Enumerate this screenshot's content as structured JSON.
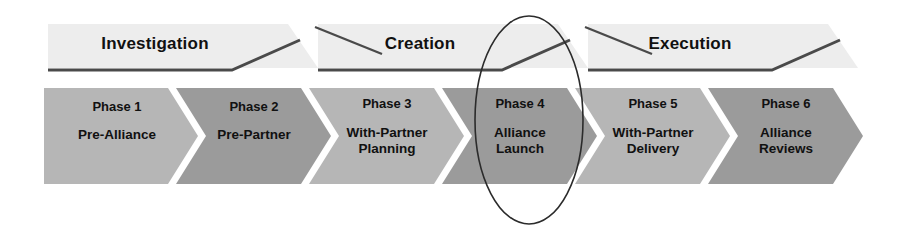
{
  "diagram": {
    "highlight": {
      "name": "ellipse-highlight",
      "target_phase": "Phase 4"
    },
    "colors": {
      "band_fill": "#ededed",
      "band_line": "#4a4a4a",
      "phase_light": "#b6b6b6",
      "phase_dark": "#9b9b9b",
      "text": "#111111",
      "highlight_stroke": "#2b2b2b",
      "background": "#ffffff"
    },
    "stages": [
      {
        "label": "Investigation",
        "label_x": 155,
        "label_y": 44
      },
      {
        "label": "Creation",
        "label_x": 420,
        "label_y": 44
      },
      {
        "label": "Execution",
        "label_x": 690,
        "label_y": 44
      }
    ],
    "phases": [
      {
        "number": "Phase 1",
        "name_line1": "Pre-Alliance",
        "name_line2": "",
        "tone": "light"
      },
      {
        "number": "Phase 2",
        "name_line1": "Pre-Partner",
        "name_line2": "",
        "tone": "dark"
      },
      {
        "number": "Phase 3",
        "name_line1": "With-Partner",
        "name_line2": "Planning",
        "tone": "light"
      },
      {
        "number": "Phase 4",
        "name_line1": "Alliance",
        "name_line2": "Launch",
        "tone": "dark"
      },
      {
        "number": "Phase 5",
        "name_line1": "With-Partner",
        "name_line2": "Delivery",
        "tone": "light"
      },
      {
        "number": "Phase 6",
        "name_line1": "Alliance",
        "name_line2": "Reviews",
        "tone": "dark"
      }
    ]
  }
}
